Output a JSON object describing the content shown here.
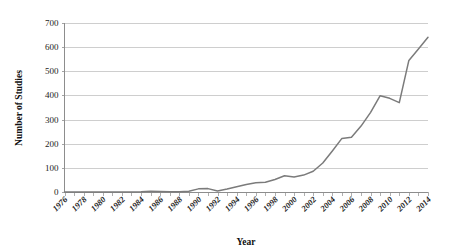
{
  "chart_data": {
    "type": "line",
    "title": "",
    "xlabel": "Year",
    "ylabel": "Number of Studies",
    "xlim": [
      1976,
      2014
    ],
    "ylim": [
      0,
      700
    ],
    "grid": true,
    "legend": false,
    "legend_position": "none",
    "line_color": "#7b7b7b",
    "background_color": "#ffffff",
    "gridline_color": "#b9b9b9",
    "axis_color": "#8d8d8d",
    "y_ticks": [
      0,
      100,
      200,
      300,
      400,
      500,
      600,
      700
    ],
    "y_tick_labels": [
      "0",
      "100",
      "200",
      "300",
      "400",
      "500",
      "600",
      "700"
    ],
    "x_tick_labels": [
      "1976",
      "1978",
      "1980",
      "1982",
      "1984",
      "1986",
      "1988",
      "1990",
      "1992",
      "1994",
      "1996",
      "1998",
      "2000",
      "2002",
      "2004",
      "2006",
      "2008",
      "2010",
      "2012",
      "2014"
    ],
    "x_minor_tick_interval": 1,
    "x_label_interval": 2,
    "x": [
      1976,
      1977,
      1978,
      1979,
      1980,
      1981,
      1982,
      1983,
      1984,
      1985,
      1986,
      1987,
      1988,
      1989,
      1990,
      1991,
      1992,
      1993,
      1994,
      1995,
      1996,
      1997,
      1998,
      1999,
      2000,
      2001,
      2002,
      2003,
      2004,
      2005,
      2006,
      2007,
      2008,
      2009,
      2010,
      2011,
      2012,
      2013,
      2014
    ],
    "values": [
      0,
      0,
      0,
      0,
      0,
      0,
      0,
      0,
      1,
      3,
      2,
      1,
      1,
      3,
      13,
      14,
      4,
      12,
      22,
      31,
      38,
      40,
      52,
      67,
      62,
      70,
      86,
      120,
      170,
      222,
      227,
      273,
      330,
      399,
      388,
      370,
      545,
      592,
      641
    ],
    "series": [
      {
        "name": "Number of Studies",
        "values": [
          0,
          0,
          0,
          0,
          0,
          0,
          0,
          0,
          1,
          3,
          2,
          1,
          1,
          3,
          13,
          14,
          4,
          12,
          22,
          31,
          38,
          40,
          52,
          67,
          62,
          70,
          86,
          120,
          170,
          222,
          227,
          273,
          330,
          399,
          388,
          370,
          545,
          592,
          641
        ]
      }
    ]
  }
}
